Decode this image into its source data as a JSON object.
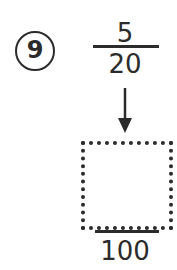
{
  "problem": {
    "number": "9",
    "fraction": {
      "numerator": "5",
      "denominator": "20"
    },
    "converted": {
      "numerator": "",
      "denominator": "100"
    },
    "arrow_icon": "down-arrow-icon"
  },
  "colors": {
    "ink": "#2b2b2b",
    "background": "#ffffff"
  }
}
